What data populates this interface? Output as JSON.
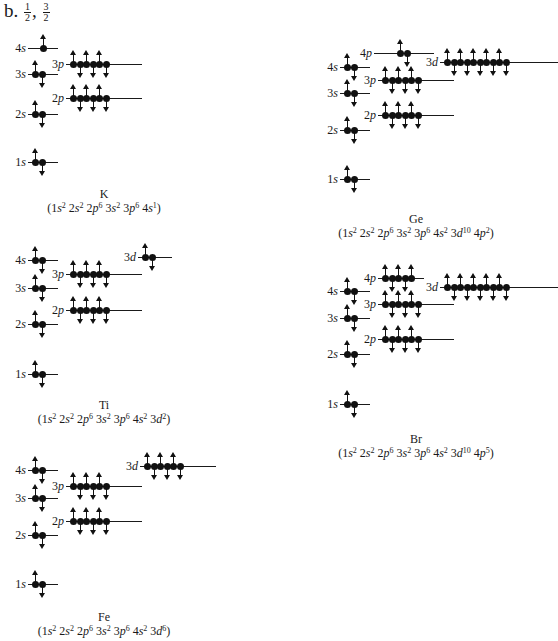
{
  "header": {
    "part_label": "b.",
    "values": [
      {
        "num": "1",
        "den": "2"
      },
      {
        "num": "3",
        "den": "2"
      }
    ],
    "separator": ","
  },
  "diagrams": [
    {
      "element": "K",
      "configuration": [
        {
          "orbital": "1s",
          "electrons": 2
        },
        {
          "orbital": "2s",
          "electrons": 2
        },
        {
          "orbital": "2p",
          "electrons": 6
        },
        {
          "orbital": "3s",
          "electrons": 2
        },
        {
          "orbital": "3p",
          "electrons": 6
        },
        {
          "orbital": "4s",
          "electrons": 1
        }
      ],
      "levels": [
        {
          "label_n": "4",
          "label_l": "s",
          "x": 28,
          "y": 48,
          "electrons": 1,
          "slots": 1,
          "line_w": 30
        },
        {
          "label_n": "3",
          "label_l": "s",
          "x": 28,
          "y": 74,
          "electrons": 2,
          "slots": 2,
          "line_w": 30
        },
        {
          "label_n": "3",
          "label_l": "p",
          "x": 66,
          "y": 64,
          "electrons": 6,
          "slots": 6,
          "line_w": 76
        },
        {
          "label_n": "2",
          "label_l": "p",
          "x": 66,
          "y": 98,
          "electrons": 6,
          "slots": 6,
          "line_w": 76
        },
        {
          "label_n": "2",
          "label_l": "s",
          "x": 28,
          "y": 114,
          "electrons": 2,
          "slots": 2,
          "line_w": 30
        },
        {
          "label_n": "1",
          "label_l": "s",
          "x": 28,
          "y": 162,
          "electrons": 2,
          "slots": 2,
          "line_w": 30
        }
      ],
      "caption_x": 104,
      "caption_y": 187
    },
    {
      "element": "Ti",
      "configuration": [
        {
          "orbital": "1s",
          "electrons": 2
        },
        {
          "orbital": "2s",
          "electrons": 2
        },
        {
          "orbital": "2p",
          "electrons": 6
        },
        {
          "orbital": "3s",
          "electrons": 2
        },
        {
          "orbital": "3p",
          "electrons": 6
        },
        {
          "orbital": "4s",
          "electrons": 2
        },
        {
          "orbital": "3d",
          "electrons": 2
        }
      ],
      "levels": [
        {
          "label_n": "4",
          "label_l": "s",
          "x": 28,
          "y": 260,
          "electrons": 2,
          "slots": 2,
          "line_w": 30
        },
        {
          "label_n": "3",
          "label_l": "d",
          "x": 138,
          "y": 257,
          "electrons": 2,
          "slots": 2,
          "line_w": 34
        },
        {
          "label_n": "3",
          "label_l": "p",
          "x": 66,
          "y": 274,
          "electrons": 6,
          "slots": 6,
          "line_w": 76
        },
        {
          "label_n": "3",
          "label_l": "s",
          "x": 28,
          "y": 288,
          "electrons": 2,
          "slots": 2,
          "line_w": 30
        },
        {
          "label_n": "2",
          "label_l": "p",
          "x": 66,
          "y": 310,
          "electrons": 6,
          "slots": 6,
          "line_w": 76
        },
        {
          "label_n": "2",
          "label_l": "s",
          "x": 28,
          "y": 324,
          "electrons": 2,
          "slots": 2,
          "line_w": 30
        },
        {
          "label_n": "1",
          "label_l": "s",
          "x": 28,
          "y": 374,
          "electrons": 2,
          "slots": 2,
          "line_w": 30
        }
      ],
      "caption_x": 104,
      "caption_y": 398
    },
    {
      "element": "Fe",
      "configuration": [
        {
          "orbital": "1s",
          "electrons": 2
        },
        {
          "orbital": "2s",
          "electrons": 2
        },
        {
          "orbital": "2p",
          "electrons": 6
        },
        {
          "orbital": "3s",
          "electrons": 2
        },
        {
          "orbital": "3p",
          "electrons": 6
        },
        {
          "orbital": "4s",
          "electrons": 2
        },
        {
          "orbital": "3d",
          "electrons": 6
        }
      ],
      "levels": [
        {
          "label_n": "4",
          "label_l": "s",
          "x": 28,
          "y": 470,
          "electrons": 2,
          "slots": 2,
          "line_w": 30
        },
        {
          "label_n": "3",
          "label_l": "d",
          "x": 140,
          "y": 466,
          "electrons": 6,
          "slots": 6,
          "line_w": 76
        },
        {
          "label_n": "3",
          "label_l": "p",
          "x": 66,
          "y": 486,
          "electrons": 6,
          "slots": 6,
          "line_w": 76
        },
        {
          "label_n": "3",
          "label_l": "s",
          "x": 28,
          "y": 498,
          "electrons": 2,
          "slots": 2,
          "line_w": 30
        },
        {
          "label_n": "2",
          "label_l": "p",
          "x": 66,
          "y": 521,
          "electrons": 6,
          "slots": 6,
          "line_w": 76
        },
        {
          "label_n": "2",
          "label_l": "s",
          "x": 28,
          "y": 535,
          "electrons": 2,
          "slots": 2,
          "line_w": 30
        },
        {
          "label_n": "1",
          "label_l": "s",
          "x": 28,
          "y": 584,
          "electrons": 2,
          "slots": 2,
          "line_w": 30
        }
      ],
      "caption_x": 104,
      "caption_y": 610
    },
    {
      "element": "Ge",
      "configuration": [
        {
          "orbital": "1s",
          "electrons": 2
        },
        {
          "orbital": "2s",
          "electrons": 2
        },
        {
          "orbital": "2p",
          "electrons": 6
        },
        {
          "orbital": "3s",
          "electrons": 2
        },
        {
          "orbital": "3p",
          "electrons": 6
        },
        {
          "orbital": "4s",
          "electrons": 2
        },
        {
          "orbital": "3d",
          "electrons": 10
        },
        {
          "orbital": "4p",
          "electrons": 2
        }
      ],
      "levels": [
        {
          "label_n": "4",
          "label_l": "p",
          "x": 374,
          "y": 53,
          "electrons": 2,
          "slots": 2,
          "line_w": 60,
          "centered": true
        },
        {
          "label_n": "4",
          "label_l": "s",
          "x": 340,
          "y": 67,
          "electrons": 2,
          "slots": 2,
          "line_w": 30
        },
        {
          "label_n": "3",
          "label_l": "d",
          "x": 440,
          "y": 62,
          "electrons": 10,
          "slots": 10,
          "line_w": 118
        },
        {
          "label_n": "3",
          "label_l": "p",
          "x": 378,
          "y": 80,
          "electrons": 6,
          "slots": 6,
          "line_w": 76
        },
        {
          "label_n": "3",
          "label_l": "s",
          "x": 340,
          "y": 93,
          "electrons": 2,
          "slots": 2,
          "line_w": 30
        },
        {
          "label_n": "2",
          "label_l": "p",
          "x": 378,
          "y": 115,
          "electrons": 6,
          "slots": 6,
          "line_w": 76
        },
        {
          "label_n": "2",
          "label_l": "s",
          "x": 340,
          "y": 130,
          "electrons": 2,
          "slots": 2,
          "line_w": 30
        },
        {
          "label_n": "1",
          "label_l": "s",
          "x": 340,
          "y": 179,
          "electrons": 2,
          "slots": 2,
          "line_w": 30
        }
      ],
      "caption_x": 416,
      "caption_y": 212
    },
    {
      "element": "Br",
      "configuration": [
        {
          "orbital": "1s",
          "electrons": 2
        },
        {
          "orbital": "2s",
          "electrons": 2
        },
        {
          "orbital": "2p",
          "electrons": 6
        },
        {
          "orbital": "3s",
          "electrons": 2
        },
        {
          "orbital": "3p",
          "electrons": 6
        },
        {
          "orbital": "4s",
          "electrons": 2
        },
        {
          "orbital": "3d",
          "electrons": 10
        },
        {
          "orbital": "4p",
          "electrons": 5
        }
      ],
      "levels": [
        {
          "label_n": "4",
          "label_l": "p",
          "x": 378,
          "y": 278,
          "electrons": 5,
          "slots": 3,
          "line_w": 46
        },
        {
          "label_n": "4",
          "label_l": "s",
          "x": 340,
          "y": 291,
          "electrons": 2,
          "slots": 2,
          "line_w": 30
        },
        {
          "label_n": "3",
          "label_l": "d",
          "x": 440,
          "y": 287,
          "electrons": 10,
          "slots": 10,
          "line_w": 118
        },
        {
          "label_n": "3",
          "label_l": "p",
          "x": 378,
          "y": 304,
          "electrons": 6,
          "slots": 6,
          "line_w": 76
        },
        {
          "label_n": "3",
          "label_l": "s",
          "x": 340,
          "y": 318,
          "electrons": 2,
          "slots": 2,
          "line_w": 30
        },
        {
          "label_n": "2",
          "label_l": "p",
          "x": 378,
          "y": 339,
          "electrons": 6,
          "slots": 6,
          "line_w": 76
        },
        {
          "label_n": "2",
          "label_l": "s",
          "x": 340,
          "y": 354,
          "electrons": 2,
          "slots": 2,
          "line_w": 30
        },
        {
          "label_n": "1",
          "label_l": "s",
          "x": 340,
          "y": 404,
          "electrons": 2,
          "slots": 2,
          "line_w": 30
        }
      ],
      "caption_x": 416,
      "caption_y": 432
    }
  ]
}
